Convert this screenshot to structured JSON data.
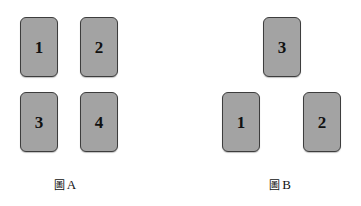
{
  "canvas": {
    "width": 361,
    "height": 206,
    "background": "#ffffff"
  },
  "style": {
    "card_fill": "#a3a3a3",
    "card_border": "#3d3d3d",
    "text_color": "#111111"
  },
  "figures": [
    {
      "id": "figure-a",
      "caption_cjk": "圖",
      "caption_letter": "A",
      "caption_full": "圖 A",
      "caption_left": 5,
      "cards": [
        {
          "label": "1",
          "x": 20,
          "y": 17
        },
        {
          "label": "2",
          "x": 80,
          "y": 17
        },
        {
          "label": "3",
          "x": 20,
          "y": 92
        },
        {
          "label": "4",
          "x": 80,
          "y": 92
        }
      ]
    },
    {
      "id": "figure-b",
      "caption_cjk": "圖",
      "caption_letter": "B",
      "caption_full": "圖 B",
      "caption_left": 220,
      "cards": [
        {
          "label": "3",
          "x": 263,
          "y": 17
        },
        {
          "label": "1",
          "x": 222,
          "y": 92
        },
        {
          "label": "2",
          "x": 303,
          "y": 92
        }
      ]
    }
  ]
}
